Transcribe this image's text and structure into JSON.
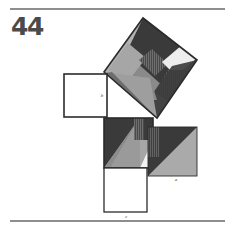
{
  "page": {
    "figure_number": "44",
    "background_color": "#ffffff",
    "rule_color": "#8e8e8e"
  },
  "figure": {
    "labels": [
      {
        "id": "label-b",
        "text": "b",
        "x": 102,
        "y": 97
      },
      {
        "id": "label-a-right",
        "text": "a",
        "x": 176,
        "y": 180
      },
      {
        "id": "label-c-bottom",
        "text": "c",
        "x": 126,
        "y": 215
      }
    ],
    "palette": {
      "dark": "#3a3a3a",
      "mid_dark": "#5f5f5f",
      "mid": "#8a8a8a",
      "light": "#a8a8a8",
      "pale": "#bfbfbf",
      "near_white": "#ededed",
      "white": "#ffffff",
      "outline": "#2b2b2b",
      "hatch": "#555555"
    },
    "squares": [
      {
        "name": "square-b-left",
        "kind": "outline-white",
        "x": 64,
        "y": 74,
        "w": 43,
        "h": 43
      },
      {
        "name": "square-c-bottom",
        "kind": "outline-white",
        "x": 104,
        "y": 168,
        "w": 43,
        "h": 44
      },
      {
        "name": "square-a-right",
        "kind": "split-diagonal",
        "x": 148,
        "y": 127,
        "w": 49,
        "h": 49
      },
      {
        "name": "square-middle",
        "kind": "dissected",
        "x": 104,
        "y": 118,
        "w": 49,
        "h": 50
      },
      {
        "name": "square-tilted-hypotenuse",
        "kind": "dissected-rotated",
        "cx": 143,
        "cy": 72,
        "size": 66,
        "angle": -42
      }
    ]
  }
}
